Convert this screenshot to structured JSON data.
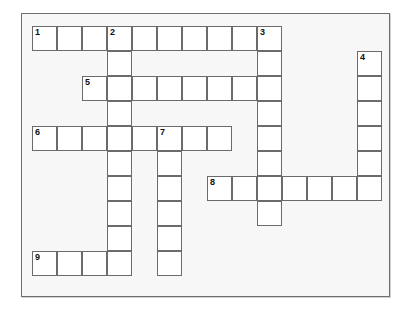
{
  "puzzle": {
    "title": "Crossword Puzzle Grid",
    "cell_size": 25,
    "origin_x": 10,
    "origin_y": 12,
    "colors": {
      "page_background": "#ffffff",
      "frame_background": "#f7f7f7",
      "frame_border": "#6e6e6e",
      "cell_fill": "#ffffff",
      "cell_border": "#6b6b6b",
      "number_color": "#111111"
    },
    "grid_columns": 14,
    "grid_rows": 10,
    "entries": [
      {
        "number": "1",
        "direction": "across",
        "row": 0,
        "col": 0,
        "length": 10
      },
      {
        "number": "2",
        "direction": "down",
        "row": 0,
        "col": 3,
        "length": 10
      },
      {
        "number": "3",
        "direction": "down",
        "row": 0,
        "col": 9,
        "length": 8
      },
      {
        "number": "4",
        "direction": "down",
        "row": 1,
        "col": 13,
        "length": 6
      },
      {
        "number": "5",
        "direction": "across",
        "row": 2,
        "col": 2,
        "length": 7
      },
      {
        "number": "6",
        "direction": "across",
        "row": 4,
        "col": 0,
        "length": 8
      },
      {
        "number": "7",
        "direction": "down",
        "row": 4,
        "col": 5,
        "length": 6
      },
      {
        "number": "8",
        "direction": "across",
        "row": 6,
        "col": 7,
        "length": 7
      },
      {
        "number": "9",
        "direction": "across",
        "row": 9,
        "col": 0,
        "length": 4
      }
    ],
    "numbered_cells": [
      {
        "label": "1",
        "row": 0,
        "col": 0
      },
      {
        "label": "2",
        "row": 0,
        "col": 3
      },
      {
        "label": "3",
        "row": 0,
        "col": 9
      },
      {
        "label": "4",
        "row": 1,
        "col": 13
      },
      {
        "label": "5",
        "row": 2,
        "col": 2
      },
      {
        "label": "6",
        "row": 4,
        "col": 0
      },
      {
        "label": "7",
        "row": 4,
        "col": 5
      },
      {
        "label": "8",
        "row": 6,
        "col": 7
      },
      {
        "label": "9",
        "row": 9,
        "col": 0
      }
    ],
    "cell_letters": {}
  }
}
